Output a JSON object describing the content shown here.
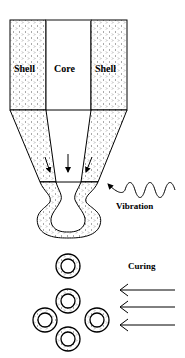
{
  "diagram": {
    "labels": {
      "shell_left": "Shell",
      "core": "Core",
      "shell_right": "Shell",
      "vibration": "Vibration",
      "curing": "Curing"
    },
    "colors": {
      "stroke": "#000000",
      "background": "#ffffff",
      "pattern_dot": "#555555"
    },
    "capsule_count": 5,
    "curing_arrow_count": 3,
    "flow_arrow_count": 3
  }
}
